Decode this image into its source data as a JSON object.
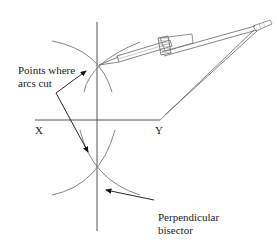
{
  "diagram": {
    "labels": {
      "point_x": "X",
      "point_y": "Y",
      "arcs_line1": "Points where",
      "arcs_line2": "arcs cut",
      "bisector_line1": "Perpendicular",
      "bisector_line2": "bisector"
    },
    "colors": {
      "line": "#555555",
      "arc": "#777777",
      "text": "#222222",
      "background": "#ffffff"
    }
  }
}
